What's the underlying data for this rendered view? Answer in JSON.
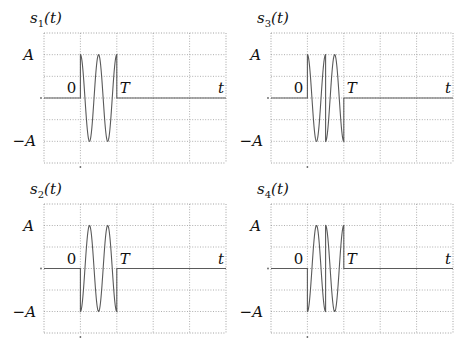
{
  "chart_data": [
    {
      "type": "line",
      "title": "s1(t)",
      "title_base": "s",
      "title_sub": "1",
      "title_arg": "(t)",
      "xlabel": "t",
      "x_labels": {
        "zero": "0",
        "end": "T"
      },
      "y_labels": {
        "pos": "A",
        "neg": "−A"
      },
      "xlim": [
        -1,
        4
      ],
      "ylim": [
        -1.5,
        1.5
      ],
      "grid": true,
      "description": "A·cos(4πt/T) on [0,T], zero elsewhere",
      "segments": [
        {
          "kind": "cos",
          "t0": 0,
          "t1": 1,
          "amp": 1,
          "cycles": 2,
          "phase": 0
        }
      ]
    },
    {
      "type": "line",
      "title": "s3(t)",
      "title_base": "s",
      "title_sub": "3",
      "title_arg": "(t)",
      "xlabel": "t",
      "x_labels": {
        "zero": "0",
        "end": "T"
      },
      "y_labels": {
        "pos": "A",
        "neg": "−A"
      },
      "xlim": [
        -1,
        4
      ],
      "ylim": [
        -1.5,
        1.5
      ],
      "grid": true,
      "description": "A·cos on [0,T/2], −A·cos on [T/2,T]",
      "segments": [
        {
          "kind": "cos",
          "t0": 0,
          "t1": 0.5,
          "amp": 1,
          "cycles": 1,
          "phase": 0
        },
        {
          "kind": "cos",
          "t0": 0.5,
          "t1": 1,
          "amp": -1,
          "cycles": 1,
          "phase": 0
        }
      ]
    },
    {
      "type": "line",
      "title": "s2(t)",
      "title_base": "s",
      "title_sub": "2",
      "title_arg": "(t)",
      "xlabel": "t",
      "x_labels": {
        "zero": "0",
        "end": "T"
      },
      "y_labels": {
        "pos": "A",
        "neg": "−A"
      },
      "xlim": [
        -1,
        4
      ],
      "ylim": [
        -1.5,
        1.5
      ],
      "grid": true,
      "description": "−A·cos(4πt/T) on [0,T], zero elsewhere",
      "segments": [
        {
          "kind": "cos",
          "t0": 0,
          "t1": 1,
          "amp": -1,
          "cycles": 2,
          "phase": 0
        }
      ]
    },
    {
      "type": "line",
      "title": "s4(t)",
      "title_base": "s",
      "title_sub": "4",
      "title_arg": "(t)",
      "xlabel": "t",
      "x_labels": {
        "zero": "0",
        "end": "T"
      },
      "y_labels": {
        "pos": "A",
        "neg": "−A"
      },
      "xlim": [
        -1,
        4
      ],
      "ylim": [
        -1.5,
        1.5
      ],
      "grid": true,
      "description": "−A·cos on [0,T/2], A·cos on [T/2,T]",
      "segments": [
        {
          "kind": "cos",
          "t0": 0,
          "t1": 0.5,
          "amp": -1,
          "cycles": 1,
          "phase": 0
        },
        {
          "kind": "cos",
          "t0": 0.5,
          "t1": 1,
          "amp": 1,
          "cycles": 1,
          "phase": 0
        }
      ]
    }
  ],
  "layout_order": [
    "top-left",
    "top-right",
    "bottom-left",
    "bottom-right"
  ]
}
